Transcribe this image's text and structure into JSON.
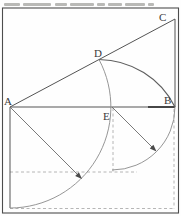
{
  "figure": {
    "type": "geometric-construction-diagram",
    "point_labels": {
      "a": "A",
      "b": "B",
      "c": "C",
      "d": "D",
      "e": "E"
    },
    "colors": {
      "frame": "#4d4d4d",
      "solid_line": "#545454",
      "bold_line": "#3c3c3c",
      "arc": "#8a8a8a",
      "dark_arc": "#5f5f5f",
      "dashed_line": "#a3a3a3",
      "arrow": "#4a4a4a",
      "label": "#3a3a3a",
      "cropped_text": "#b9b9b6",
      "background": "#fefefe"
    },
    "top_strip": {
      "description": "bottom sliver of a cropped, illegible caption line",
      "segments": [
        {
          "x": 4,
          "w": 16
        },
        {
          "x": 23,
          "w": 28
        },
        {
          "x": 55,
          "w": 12
        },
        {
          "x": 70,
          "w": 24
        },
        {
          "x": 97,
          "w": 8
        },
        {
          "x": 108,
          "w": 14
        },
        {
          "x": 125,
          "w": 20
        },
        {
          "x": 148,
          "w": 6
        }
      ]
    }
  }
}
